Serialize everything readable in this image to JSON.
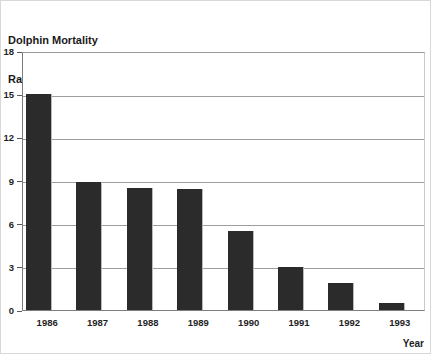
{
  "chart_data": {
    "type": "bar",
    "title": "Dolphin Mortality Rate",
    "title_lines": [
      "Dolphin Mortality",
      "Rate"
    ],
    "xlabel": "Year",
    "ylabel": "",
    "categories": [
      "1986",
      "1987",
      "1988",
      "1989",
      "1990",
      "1991",
      "1992",
      "1993"
    ],
    "values": [
      15.0,
      8.9,
      8.5,
      8.4,
      5.5,
      3.0,
      1.9,
      0.5
    ],
    "ylim": [
      0,
      18
    ],
    "yticks": [
      0,
      3,
      6,
      9,
      12,
      15,
      18
    ],
    "ytick_labels": [
      "0",
      "3",
      "6",
      "9",
      "12",
      "15",
      "18"
    ],
    "grid": true,
    "legend": "none",
    "series": [
      {
        "name": "Dolphin Mortality Rate",
        "values": [
          15.0,
          8.9,
          8.5,
          8.4,
          5.5,
          3.0,
          1.9,
          0.5
        ]
      }
    ],
    "colors": {
      "bar": "#2b2b2b",
      "gridline": "#9d9d9d",
      "frame": "#7d7d7d",
      "background": "#ffffff",
      "text": "#1f1f1f"
    }
  }
}
